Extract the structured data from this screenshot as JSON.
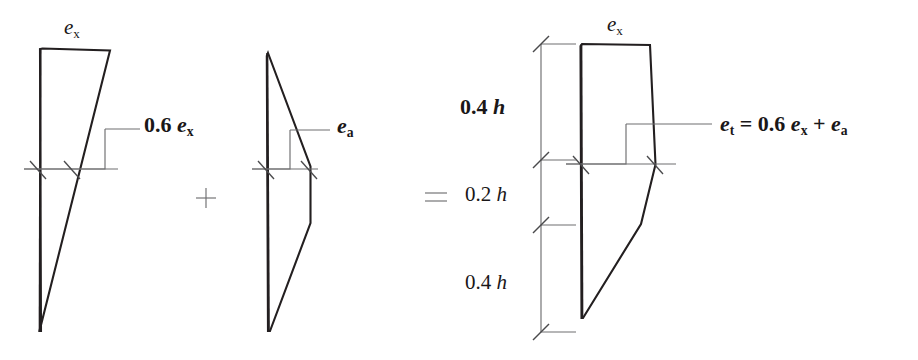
{
  "figure": {
    "background_color": "#ffffff",
    "outline_color": "#231f20",
    "leader_color": "#6e6e70",
    "tick_color": "#4a4a4c"
  },
  "panels": {
    "left": {
      "name": "structural-eccentricity-diagram",
      "top_label": "e",
      "top_label_sub": "x",
      "value_label_prefix": "0.6 ",
      "value_label_symbol": "e",
      "value_label_sub": "x"
    },
    "middle": {
      "name": "accidental-eccentricity-diagram",
      "value_label_symbol": "e",
      "value_label_sub": "a"
    },
    "right": {
      "name": "total-eccentricity-diagram",
      "top_label": "e",
      "top_label_sub": "x",
      "result_lhs_symbol": "e",
      "result_lhs_sub": "t",
      "result_eq": " = 0.6 ",
      "result_term1_symbol": "e",
      "result_term1_sub": "x",
      "result_plus": " + ",
      "result_term2_symbol": "e",
      "result_term2_sub": "a"
    }
  },
  "operators": {
    "plus": "+",
    "equals": "="
  },
  "dimensions": [
    {
      "label_number": "0.4 ",
      "label_symbol": "h",
      "emphasis": "bold",
      "fraction": 0.4
    },
    {
      "label_number": "0.2 ",
      "label_symbol": "h",
      "emphasis": "plain",
      "fraction": 0.2
    },
    {
      "label_number": "0.4 ",
      "label_symbol": "h",
      "emphasis": "plain",
      "fraction": 0.4
    }
  ],
  "geometry": {
    "left_shape_points": "42,48 110,50 39,331 40,49",
    "left_baseline_y": 169,
    "middle_shape_points": "268,53 310,166 310,223 270,331 267,56",
    "middle_baseline_y": 169,
    "right_shape_points": "582,44 650,45 655,165 641,224 583,318 581,46",
    "right_baseline_y": 164,
    "dim_axis_x": 541,
    "dim_tick_ys": [
      44,
      160,
      225,
      332
    ]
  }
}
